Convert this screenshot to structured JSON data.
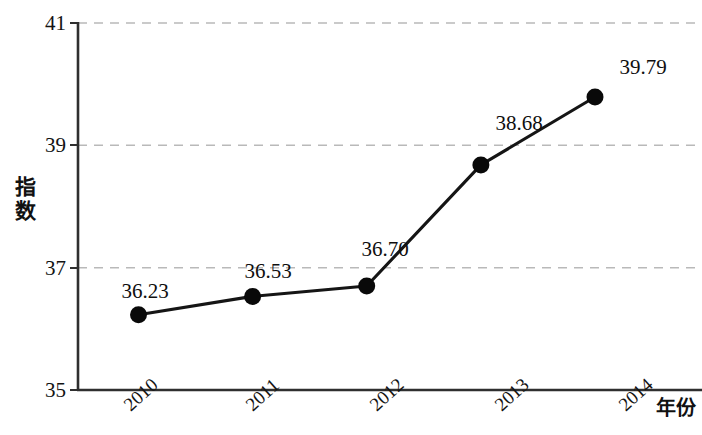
{
  "chart_data": {
    "type": "line",
    "title": "",
    "subtitle": "",
    "xlabel": "年份",
    "ylabel": "指数",
    "categories": [
      "2010",
      "2011",
      "2012",
      "2013",
      "2014"
    ],
    "values": [
      36.23,
      36.53,
      36.7,
      38.68,
      39.79
    ],
    "point_labels": [
      "36.23",
      "36.53",
      "36.70",
      "38.68",
      "39.79"
    ],
    "series": [
      {
        "name": "指数",
        "values": [
          36.23,
          36.53,
          36.7,
          38.68,
          39.79
        ]
      }
    ],
    "ylim": [
      35,
      41
    ],
    "y_ticks": [
      35,
      37,
      39,
      41
    ],
    "y_tick_labels": [
      "35",
      "37",
      "39",
      "41"
    ],
    "x_tick_labels": [
      "2010",
      "2011",
      "2012",
      "2013",
      "2014"
    ],
    "grid": true,
    "gridlines_at": [
      37,
      39,
      41
    ],
    "legend": "none",
    "marker": "filled-circle",
    "line_color": "#111111",
    "marker_color": "#0a0a0a",
    "grid_color": "#b9b9b9",
    "axis_color": "#2b2b2b",
    "x_tick_rotation_deg": -42
  },
  "axes": {
    "y_title_chars": [
      "指",
      "数"
    ],
    "x_title": "年份"
  }
}
